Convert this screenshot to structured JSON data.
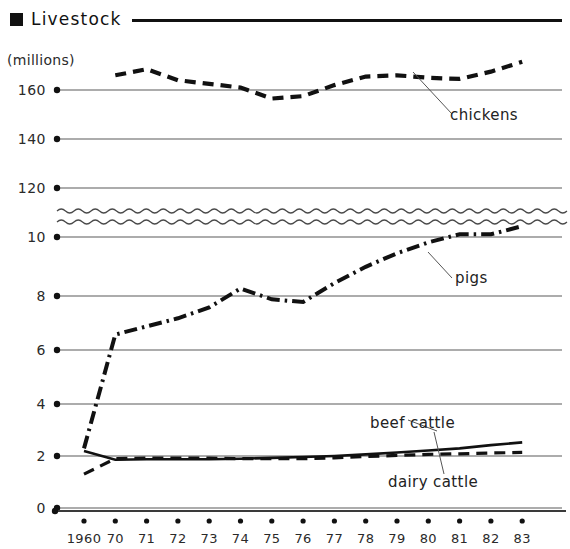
{
  "header": {
    "marker_icon": "filled-square-icon",
    "title": "Livestock"
  },
  "axis_units_label": "(millions)",
  "chart_data": {
    "type": "line",
    "title": "Livestock",
    "xlabel": "",
    "ylabel": "(millions)",
    "grid": true,
    "legend_position": "inline-annotations",
    "axis_break": {
      "present": true,
      "style": "double-wavy-line",
      "between": [
        120,
        10
      ]
    },
    "x": [
      1960,
      1970,
      1971,
      1972,
      1973,
      1974,
      1975,
      1976,
      1977,
      1978,
      1979,
      1980,
      1981,
      1982,
      1983
    ],
    "xtick_labels": [
      "1960",
      "70",
      "71",
      "72",
      "73",
      "74",
      "75",
      "76",
      "77",
      "78",
      "79",
      "80",
      "81",
      "82",
      "83"
    ],
    "upper_panel": {
      "ytick_labels": [
        "160",
        "140",
        "120"
      ],
      "ytick_values": [
        160,
        140,
        120
      ],
      "ylim": [
        110,
        180
      ]
    },
    "lower_panel": {
      "ytick_labels": [
        "10",
        "8",
        "6",
        "4",
        "2",
        "0"
      ],
      "ytick_values": [
        10,
        8,
        6,
        4,
        2,
        0
      ],
      "ylim": [
        0,
        11
      ]
    },
    "series": [
      {
        "name": "chickens",
        "label": "chickens",
        "panel": "upper",
        "line_style": "dashed",
        "values": [
          null,
          166.0,
          168.5,
          164.0,
          162.5,
          161.0,
          156.5,
          157.5,
          162.0,
          165.5,
          166.0,
          165.0,
          164.5,
          167.5,
          171.5
        ]
      },
      {
        "name": "pigs",
        "label": "pigs",
        "panel": "lower",
        "line_style": "dash-dot",
        "values": [
          2.2,
          6.4,
          6.7,
          7.0,
          7.4,
          8.1,
          7.7,
          7.6,
          8.3,
          8.9,
          9.4,
          9.8,
          10.1,
          10.1,
          10.4
        ]
      },
      {
        "name": "beef-cattle",
        "label": "beef cattle",
        "panel": "lower",
        "line_style": "solid",
        "values": [
          2.1,
          1.78,
          1.8,
          1.8,
          1.8,
          1.82,
          1.85,
          1.88,
          1.92,
          1.98,
          2.05,
          2.12,
          2.2,
          2.32,
          2.42
        ]
      },
      {
        "name": "dairy-cattle",
        "label": "dairy cattle",
        "panel": "lower",
        "line_style": "dashed",
        "values": [
          1.25,
          1.82,
          1.84,
          1.84,
          1.84,
          1.82,
          1.82,
          1.82,
          1.85,
          1.9,
          1.94,
          1.98,
          2.0,
          2.03,
          2.05
        ]
      }
    ],
    "annotations": [
      {
        "name": "chickens-label",
        "text": "chickens",
        "x": 450,
        "y": 120
      },
      {
        "name": "pigs-label",
        "text": "pigs",
        "x": 455,
        "y": 283
      },
      {
        "name": "beef-cattle-label",
        "text": "beef cattle",
        "x": 370,
        "y": 428
      },
      {
        "name": "dairy-cattle-label",
        "text": "dairy cattle",
        "x": 388,
        "y": 487
      }
    ]
  }
}
